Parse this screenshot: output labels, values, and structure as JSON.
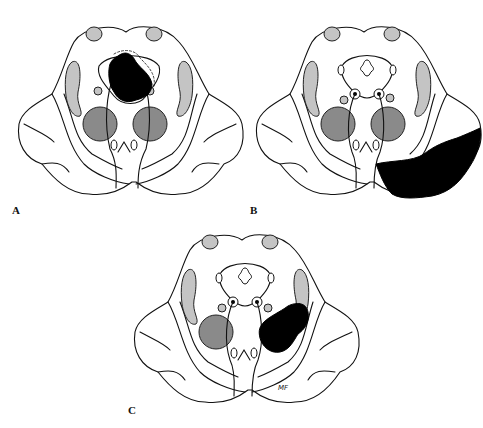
{
  "figure": {
    "panels": [
      {
        "id": "A",
        "label": "A",
        "lesion": "dorsal-midline",
        "fourth_ventricle_visible": false
      },
      {
        "id": "B",
        "label": "B",
        "lesion": "right-lateral-ventral-large",
        "fourth_ventricle_visible": true
      },
      {
        "id": "C",
        "label": "C",
        "lesion": "right-paramedian-ventral",
        "fourth_ventricle_visible": true
      }
    ],
    "signature": "MF",
    "colors": {
      "background": "#ffffff",
      "outline": "#111111",
      "light_nucleus": "#c4c4c4",
      "dark_nucleus": "#8a8a8a",
      "lesion": "#000000"
    }
  }
}
